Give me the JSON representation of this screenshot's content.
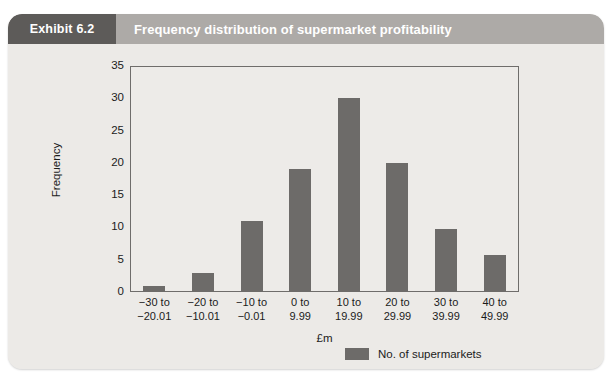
{
  "exhibit": {
    "tag": "Exhibit 6.2",
    "caption": "Frequency distribution of supermarket profitability"
  },
  "chart_data": {
    "type": "bar",
    "title": "Frequency distribution of supermarket profitability",
    "categories": [
      "−30 to −20.01",
      "−20 to −10.01",
      "−10 to −0.01",
      "0 to 9.99",
      "10 to 19.99",
      "20 to 29.99",
      "30 to 39.99",
      "40 to 49.99"
    ],
    "category_lines": [
      [
        "−30 to",
        "−20.01"
      ],
      [
        "−20 to",
        "−10.01"
      ],
      [
        "−10 to",
        "−0.01"
      ],
      [
        "0 to",
        "9.99"
      ],
      [
        "10 to",
        "19.99"
      ],
      [
        "20 to",
        "29.99"
      ],
      [
        "30 to",
        "39.99"
      ],
      [
        "40 to",
        "49.99"
      ]
    ],
    "values": [
      1,
      3,
      11,
      19,
      30,
      20,
      9.7,
      5.7
    ],
    "series": [
      {
        "name": "No. of supermarkets",
        "values": [
          1,
          3,
          11,
          19,
          30,
          20,
          9.7,
          5.7
        ],
        "color": "#6d6b69"
      }
    ],
    "xlabel": "£m",
    "ylabel": "Frequency",
    "ylim": [
      0,
      35
    ],
    "yticks": [
      0,
      5,
      10,
      15,
      20,
      25,
      30,
      35
    ],
    "ytick_labels": [
      "0",
      "5",
      "10",
      "15",
      "20",
      "25",
      "30",
      "35"
    ],
    "grid": false,
    "legend": {
      "position": "bottom-right",
      "entries": [
        "No. of supermarkets"
      ]
    }
  },
  "colors": {
    "bar": "#6d6b69",
    "header_band": "#adaaa7",
    "header_tag": "#5d5b59",
    "card_background": "#eceae7",
    "axis": "#6f6d6b"
  }
}
